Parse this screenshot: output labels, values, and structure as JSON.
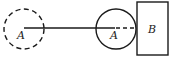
{
  "diagram": {
    "initial_circle": {
      "label": "A",
      "style": "dashed"
    },
    "final_circle": {
      "label": "A",
      "style": "solid"
    },
    "block": {
      "label": "B"
    },
    "colors": {
      "stroke": "#1a1a1a",
      "background": "#ffffff"
    }
  }
}
